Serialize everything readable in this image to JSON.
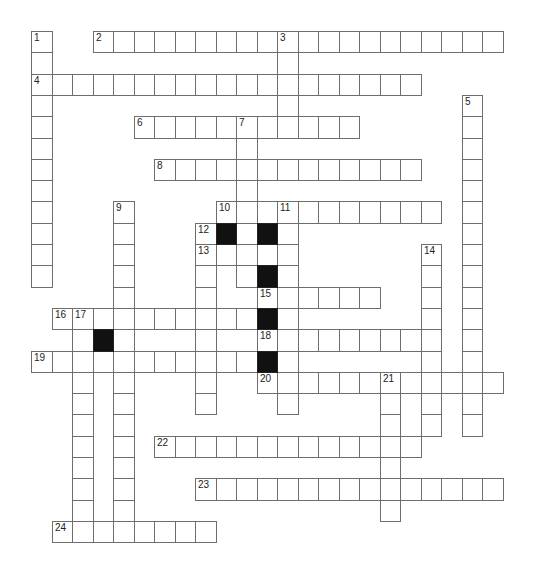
{
  "puzzle": {
    "type": "crossword",
    "grid": {
      "cols": 23,
      "rows": 24,
      "origin_x": 31,
      "origin_y": 31,
      "cell_w": 20.5,
      "cell_h": 21.3
    },
    "colors": {
      "cell_fill": "#ffffff",
      "cell_border": "#6e6e6e",
      "block_fill": "#111111",
      "number": "#222222"
    },
    "entries": [
      {
        "number": "1",
        "direction": "down",
        "row": 0,
        "col": 0,
        "length": 12
      },
      {
        "number": "2",
        "direction": "across",
        "row": 0,
        "col": 3,
        "length": 20
      },
      {
        "number": "3",
        "direction": "down",
        "row": 0,
        "col": 12,
        "length": 5
      },
      {
        "number": "4",
        "direction": "across",
        "row": 2,
        "col": 0,
        "length": 19
      },
      {
        "number": "5",
        "direction": "down",
        "row": 3,
        "col": 21,
        "length": 16
      },
      {
        "number": "6",
        "direction": "across",
        "row": 4,
        "col": 5,
        "length": 11
      },
      {
        "number": "7",
        "direction": "down",
        "row": 4,
        "col": 10,
        "length": 8
      },
      {
        "number": "8",
        "direction": "across",
        "row": 6,
        "col": 6,
        "length": 13
      },
      {
        "number": "9",
        "direction": "down",
        "row": 8,
        "col": 4,
        "length": 16
      },
      {
        "number": "10",
        "direction": "across",
        "row": 8,
        "col": 9,
        "length": 11
      },
      {
        "number": "11",
        "direction": "down",
        "row": 8,
        "col": 12,
        "length": 10
      },
      {
        "number": "12",
        "direction": "down",
        "row": 9,
        "col": 8,
        "length": 9
      },
      {
        "number": "13",
        "direction": "across",
        "row": 10,
        "col": 8,
        "length": 5
      },
      {
        "number": "14",
        "direction": "down",
        "row": 10,
        "col": 19,
        "length": 9
      },
      {
        "number": "15",
        "direction": "across",
        "row": 12,
        "col": 11,
        "length": 6
      },
      {
        "number": "16",
        "direction": "across",
        "row": 13,
        "col": 1,
        "length": 10
      },
      {
        "number": "17",
        "direction": "down",
        "row": 13,
        "col": 2,
        "length": 11
      },
      {
        "number": "18",
        "direction": "across",
        "row": 14,
        "col": 11,
        "length": 9
      },
      {
        "number": "19",
        "direction": "across",
        "row": 15,
        "col": 0,
        "length": 11
      },
      {
        "number": "20",
        "direction": "across",
        "row": 16,
        "col": 11,
        "length": 12
      },
      {
        "number": "21",
        "direction": "down",
        "row": 16,
        "col": 17,
        "length": 7
      },
      {
        "number": "22",
        "direction": "across",
        "row": 19,
        "col": 6,
        "length": 13
      },
      {
        "number": "23",
        "direction": "across",
        "row": 21,
        "col": 8,
        "length": 15
      },
      {
        "number": "24",
        "direction": "across",
        "row": 23,
        "col": 1,
        "length": 8
      }
    ],
    "black_cells": [
      {
        "row": 9,
        "col": 9
      },
      {
        "row": 9,
        "col": 11
      },
      {
        "row": 11,
        "col": 11
      },
      {
        "row": 13,
        "col": 11
      },
      {
        "row": 14,
        "col": 3
      },
      {
        "row": 15,
        "col": 11
      }
    ]
  }
}
